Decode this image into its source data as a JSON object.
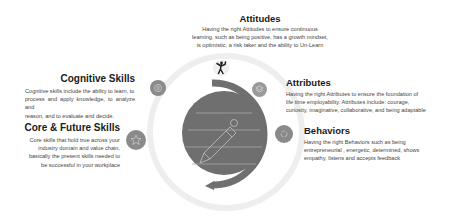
{
  "diagram": {
    "center": {
      "icon": "pencil-notepad-icon"
    },
    "items": [
      {
        "id": "attitudes",
        "title": "Attitudes",
        "icon": "person-celebrating-icon",
        "lines": [
          "Having the right Attitudes to ensure continuous",
          "learning, such as being positive, has a growth mindset,",
          "is optimistic, a risk taker and the ability to Un-Learn"
        ]
      },
      {
        "id": "cognitive",
        "title": "Cognitive Skills",
        "icon": "brain-icon",
        "lines": [
          "Cognitive skills include the ability to learn, to",
          "process and apply knowledge, to analyze and",
          "reason, and to evaluate and decide."
        ]
      },
      {
        "id": "core",
        "title": "Core & Future Skills",
        "icon": "star-icon",
        "lines": [
          "Core skills that hold true across your",
          "industry domain and value chain,",
          "basically the present skills needed to",
          "be successful in your workplace"
        ]
      },
      {
        "id": "attributes",
        "title": "Attributes",
        "icon": "layers-icon",
        "lines": [
          "Having the right Attributes to ensure the foundation of",
          "life time employability. Attributes include: courage,",
          "curiosity, imaginative, collaborative, and being adaptable"
        ]
      },
      {
        "id": "behaviors",
        "title": "Behaviors",
        "icon": "refresh-cycle-icon",
        "lines": [
          "Having the right Behaviors such as being",
          "entrepreneurial , energetic, determined, shows",
          "empathy, listens and accepts feedback"
        ]
      }
    ],
    "colors": {
      "main_gray": "#6f6f6f",
      "icon_gray": "#8a8a8a",
      "ring_light": "#ececec"
    }
  }
}
